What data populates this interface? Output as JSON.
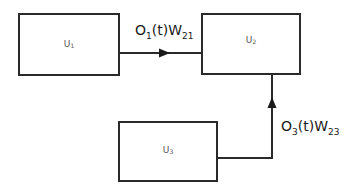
{
  "diagram": {
    "nodes": [
      {
        "id": "U1",
        "base": "U",
        "sub": "1"
      },
      {
        "id": "U2",
        "base": "U",
        "sub": "2"
      },
      {
        "id": "U3",
        "base": "U",
        "sub": "3"
      }
    ],
    "edges": [
      {
        "from": "U1",
        "to": "U2",
        "label": {
          "o": "O",
          "o_sub": "1",
          "mid": "(t)W",
          "w_sub": "21"
        }
      },
      {
        "from": "U3",
        "to": "U2",
        "label": {
          "o": "O",
          "o_sub": "3",
          "mid": "(t)W",
          "w_sub": "23"
        }
      }
    ],
    "colors": {
      "stroke": "#2a2a2a",
      "node_text": "#555555",
      "edge_text": "#1a1a1a"
    }
  }
}
